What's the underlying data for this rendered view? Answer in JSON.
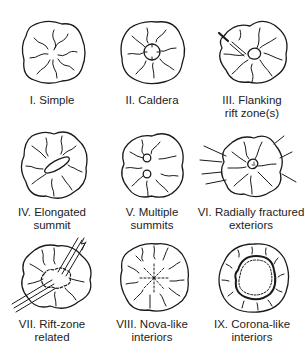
{
  "diagram": {
    "items": [
      {
        "id": "I",
        "label": "I. Simple",
        "label_lines": [
          "I. Simple"
        ],
        "feature": "simple"
      },
      {
        "id": "II",
        "label": "II. Caldera",
        "label_lines": [
          "II. Caldera"
        ],
        "feature": "caldera"
      },
      {
        "id": "III",
        "label": "III. Flanking rift zone(s)",
        "label_lines": [
          "III. Flanking",
          "rift zone(s)"
        ],
        "feature": "flanking-rift"
      },
      {
        "id": "IV",
        "label": "IV. Elongated summit",
        "label_lines": [
          "IV. Elongated",
          "summit"
        ],
        "feature": "elongated-summit"
      },
      {
        "id": "V",
        "label": "V. Multiple summits",
        "label_lines": [
          "V. Multiple",
          "summits"
        ],
        "feature": "multiple-summits"
      },
      {
        "id": "VI",
        "label": "VI. Radially fractured exteriors",
        "label_lines": [
          "VI. Radially fractured",
          "exteriors"
        ],
        "feature": "radial-fractures"
      },
      {
        "id": "VII",
        "label": "VII. Rift-zone related",
        "label_lines": [
          "VII. Rift-zone",
          "related"
        ],
        "feature": "rift-zone"
      },
      {
        "id": "VIII",
        "label": "VIII. Nova-like interiors",
        "label_lines": [
          "VIII. Nova-like",
          "interiors"
        ],
        "feature": "nova"
      },
      {
        "id": "IX",
        "label": "IX. Corona-like interiors",
        "label_lines": [
          "IX. Corona-like",
          "interiors"
        ],
        "feature": "corona"
      }
    ]
  },
  "colors": {
    "line": "#1a1a1a",
    "background": "#ffffff"
  }
}
